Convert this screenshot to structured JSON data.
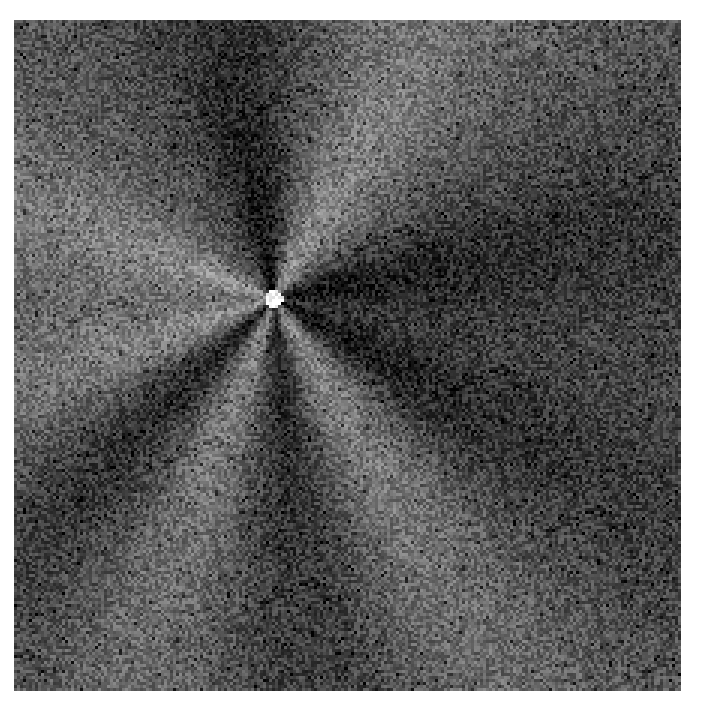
{
  "image": {
    "description": "Grayscale noisy diffraction-like pattern with radial bright and dark lobes emanating from a bright central point",
    "colormap": "grayscale",
    "background_gray": 85,
    "lobes": [
      {
        "angle_deg": 200,
        "tone": "bright"
      },
      {
        "angle_deg": 225,
        "tone": "dark"
      },
      {
        "angle_deg": 250,
        "tone": "bright"
      },
      {
        "angle_deg": 275,
        "tone": "dark"
      },
      {
        "angle_deg": 300,
        "tone": "bright"
      },
      {
        "angle_deg": 330,
        "tone": "dark"
      },
      {
        "angle_deg": 10,
        "tone": "dark"
      },
      {
        "angle_deg": 60,
        "tone": "bright"
      },
      {
        "angle_deg": 100,
        "tone": "dark"
      },
      {
        "angle_deg": 160,
        "tone": "bright"
      }
    ]
  }
}
